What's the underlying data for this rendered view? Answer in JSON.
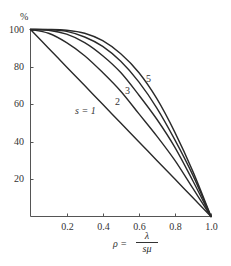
{
  "chart_data": {
    "type": "line",
    "title": "",
    "ylabel": "%",
    "xlabel": "ρ = λ / sμ",
    "xlabel_parts": {
      "lhs": "ρ =",
      "numerator": "λ",
      "denominator": "sμ"
    },
    "xlim": [
      0,
      1.0
    ],
    "ylim": [
      0,
      100
    ],
    "grid": false,
    "x_ticks": [
      "0.2",
      "0.4",
      "0.6",
      "0.8",
      "1.0"
    ],
    "y_ticks": [
      "20",
      "40",
      "60",
      "80",
      "100"
    ],
    "x": [
      0.0,
      0.1,
      0.2,
      0.3,
      0.4,
      0.5,
      0.6,
      0.7,
      0.8,
      0.9,
      1.0
    ],
    "series": [
      {
        "name": "s = 1",
        "label": "s = 1",
        "values": [
          100,
          90,
          80,
          70,
          60,
          50,
          40,
          30,
          20,
          10,
          0
        ]
      },
      {
        "name": "s = 2",
        "label": "2",
        "values": [
          100,
          98,
          93,
          86,
          77,
          67,
          55,
          43,
          30,
          15,
          0
        ]
      },
      {
        "name": "s = 3",
        "label": "3",
        "values": [
          100,
          99.6,
          97.5,
          93,
          86,
          77,
          65,
          52,
          37,
          19,
          0
        ]
      },
      {
        "name": "s = 4",
        "label": "",
        "values": [
          100,
          99.9,
          99,
          96,
          91,
          83,
          72,
          58,
          41,
          22,
          0
        ]
      },
      {
        "name": "s = 5",
        "label": "5",
        "values": [
          100,
          100,
          99.6,
          98,
          94,
          87,
          77,
          63,
          45,
          24,
          0
        ]
      }
    ],
    "annotations": [
      "s = 1",
      "2",
      "3",
      "5"
    ],
    "legend": "none (inline curve labels)"
  },
  "axis": {
    "y_unit": "%",
    "x_tick_labels": [
      "0.2",
      "0.4",
      "0.6",
      "0.8",
      "1.0"
    ],
    "y_tick_labels": [
      "20",
      "40",
      "60",
      "80",
      "100"
    ]
  },
  "labels": {
    "s1": "s = 1",
    "s2": "2",
    "s3": "3",
    "s5": "5",
    "rho_lhs": "ρ =",
    "rho_num": "λ",
    "rho_den": "sμ"
  },
  "colors": {
    "line": "#2a2a2a",
    "axis": "#555555",
    "background": "#ffffff"
  }
}
